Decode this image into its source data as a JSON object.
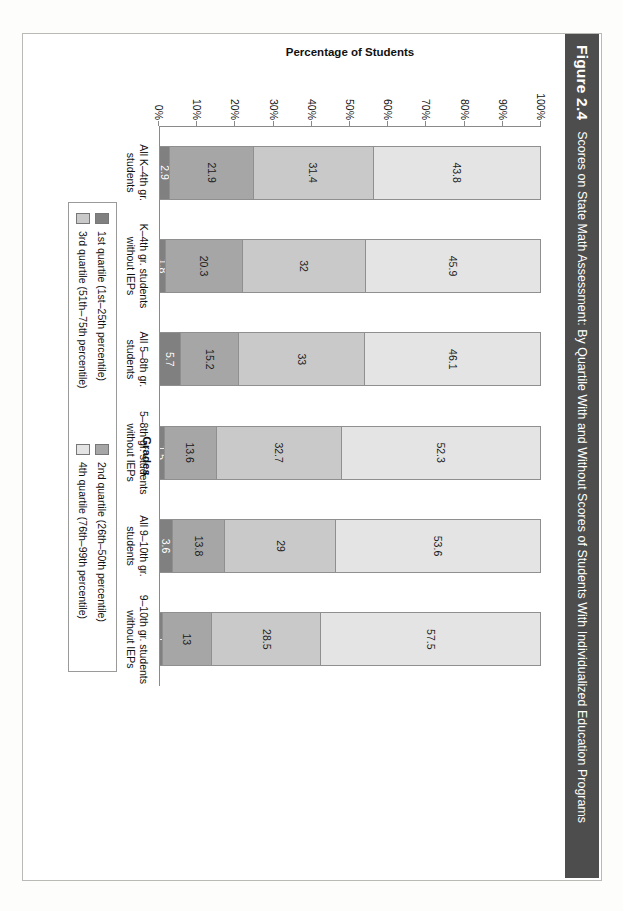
{
  "figure": {
    "number": "Figure 2.4",
    "title": "Scores on State Math Assessment: By Quartile With and Without Scores of Students With Individualized Education Programs"
  },
  "colors": {
    "q1": "#808080",
    "q2": "#a6a6a6",
    "q3": "#c9c9c9",
    "q4": "#e4e4e4",
    "title_bar": "#4d4d4d",
    "axis": "#8a8a8a"
  },
  "chart_data": {
    "type": "bar",
    "title": "Scores on State Math Assessment: By Quartile With and Without Scores of Students With Individualized Education Programs",
    "xlabel": "Grades",
    "ylabel": "Percentage of Students",
    "ylim": [
      0,
      100
    ],
    "grid": false,
    "stacked": true,
    "orientation": "vertical",
    "legend_position": "bottom",
    "ytick_labels": [
      "100%",
      "90%",
      "80%",
      "70%",
      "60%",
      "50%",
      "40%",
      "30%",
      "20%",
      "10%",
      "0%"
    ],
    "categories": [
      "All K–4th gr. students",
      "K–4th gr. students without IEPs",
      "All 5–8th gr. students",
      "5–8th gr. students without IEPs",
      "All 9–10th gr. students",
      "9–10th gr. students without IEPs"
    ],
    "category_lines": [
      [
        "All K–4th gr.",
        "students"
      ],
      [
        "K–4th gr. students",
        "without IEPs"
      ],
      [
        "All 5–8th gr.",
        "students"
      ],
      [
        "5–8th gr. students",
        "without IEPs"
      ],
      [
        "All 9–10th gr.",
        "students"
      ],
      [
        "9–10th gr. students",
        "without IEPs"
      ]
    ],
    "series": [
      {
        "name": "1st quartile (1st–25th percentile)",
        "values": [
          2.9,
          1.8,
          5.7,
          1.5,
          3.6,
          1
        ]
      },
      {
        "name": "2nd quartile (26th–50th percentile)",
        "values": [
          21.9,
          20.3,
          15.2,
          13.6,
          13.8,
          13
        ]
      },
      {
        "name": "3rd quartile (51th–75th percentile)",
        "values": [
          31.4,
          32,
          33,
          32.7,
          29,
          28.5
        ]
      },
      {
        "name": "4th quartile (76th–99th percentile)",
        "values": [
          43.8,
          45.9,
          46.1,
          52.3,
          53.6,
          57.5
        ]
      }
    ],
    "value_labels": [
      [
        "2.9",
        "21.9",
        "31.4",
        "43.8"
      ],
      [
        "1.8",
        "20.3",
        "32",
        "45.9"
      ],
      [
        "5.7",
        "15.2",
        "33",
        "46.1"
      ],
      [
        "1.5",
        "13.6",
        "32.7",
        "52.3"
      ],
      [
        "3.6",
        "13.8",
        "29",
        "53.6"
      ],
      [
        "1",
        "13",
        "28.5",
        "57.5"
      ]
    ]
  },
  "legend": {
    "items": [
      {
        "label": "1st quartile (1st–25th percentile)",
        "color": "#808080"
      },
      {
        "label": "2nd quartile (26th–50th percentile)",
        "color": "#a6a6a6"
      },
      {
        "label": "3rd quartile (51th–75th percentile)",
        "color": "#c9c9c9"
      },
      {
        "label": "4th quartile (76th–99th percentile)",
        "color": "#e4e4e4"
      }
    ]
  }
}
